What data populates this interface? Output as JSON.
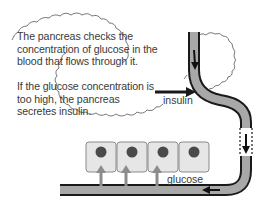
{
  "callout": {
    "paragraph1": "The pancreas checks the concentration of glucose in the blood that flows through it.",
    "paragraph2": "If the glucose concentration is too high, the pancreas secretes insulin."
  },
  "labels": {
    "insulin": "insulin",
    "glucose": "glucose"
  },
  "cells": {
    "count": 4
  },
  "colors": {
    "vessel_fill": "#a8a8a8",
    "vessel_outline": "#1a1a1a",
    "cell_fill": "#e6e6e6",
    "cell_border": "#8a8a8a",
    "nucleus": "#4a4a4a",
    "glucose_arrow": "#8c8c8c",
    "text": "#3a3a3a"
  }
}
